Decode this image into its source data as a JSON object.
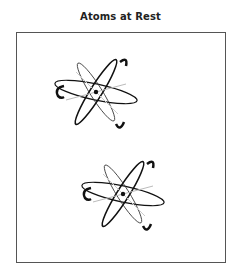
{
  "figure": {
    "title": "Atoms at Rest",
    "atoms": [
      {
        "label": "atom-1",
        "cx": 96,
        "cy": 91
      },
      {
        "label": "atom-2",
        "cx": 123,
        "cy": 193
      }
    ],
    "colors": {
      "stroke_dark": "#111111",
      "stroke_light": "#bbbbbb",
      "frame": "#555555"
    }
  }
}
